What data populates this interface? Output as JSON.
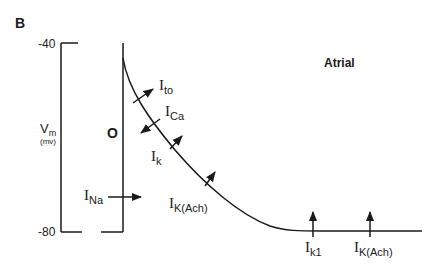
{
  "panel_label": "B",
  "title": "Atrial",
  "axis": {
    "label_main": "V",
    "label_sub": "m",
    "unit": "(mv)",
    "tick_top": "-40",
    "tick_bottom": "-80"
  },
  "phase_label": "O",
  "currents": [
    {
      "id": "ito",
      "main": "I",
      "sub": "to",
      "direction": "outward"
    },
    {
      "id": "ica",
      "main": "I",
      "sub": "Ca",
      "direction": "inward"
    },
    {
      "id": "ik",
      "main": "I",
      "sub": "k",
      "direction": "outward"
    },
    {
      "id": "ikach1",
      "main": "I",
      "sub": "K(Ach)",
      "direction": "outward"
    },
    {
      "id": "ina",
      "main": "I",
      "sub": "Na",
      "direction": "inward"
    },
    {
      "id": "ik1",
      "main": "I",
      "sub": "k1",
      "direction": "outward"
    },
    {
      "id": "ikach2",
      "main": "I",
      "sub": "K(Ach)",
      "direction": "outward"
    }
  ],
  "colors": {
    "line": "#1a1a1a",
    "background": "#ffffff"
  }
}
